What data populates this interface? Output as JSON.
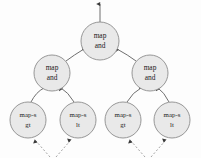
{
  "diagram": {
    "type": "tree",
    "background_color": "#fdfdfd",
    "node_fill_color": "#e9e9e9",
    "node_stroke_color": "#8c8c8c",
    "edge_color": "#6f6f6f",
    "dashed_edge_color": "#9a9a9a",
    "text_color": "#1a1a1a",
    "nodes": [
      {
        "id": "root",
        "level": 0,
        "line1": "map",
        "line2": "and",
        "cx": 100,
        "cy": 41,
        "r": 19
      },
      {
        "id": "mid-left",
        "level": 1,
        "line1": "map",
        "line2": "and",
        "cx": 52,
        "cy": 73,
        "r": 18
      },
      {
        "id": "mid-right",
        "level": 1,
        "line1": "map",
        "line2": "and",
        "cx": 150,
        "cy": 73,
        "r": 18
      },
      {
        "id": "leaf-1",
        "level": 2,
        "line1": "map-s",
        "line2": "gt",
        "cx": 28,
        "cy": 120,
        "r": 18
      },
      {
        "id": "leaf-2",
        "level": 2,
        "line1": "map-s",
        "line2": "lt",
        "cx": 78,
        "cy": 120,
        "r": 18
      },
      {
        "id": "leaf-3",
        "level": 2,
        "line1": "map-s",
        "line2": "gt",
        "cx": 123,
        "cy": 120,
        "r": 18
      },
      {
        "id": "leaf-4",
        "level": 2,
        "line1": "map-s",
        "line2": "lt",
        "cx": 172,
        "cy": 120,
        "r": 18
      }
    ],
    "edges": [
      {
        "from": "root",
        "to": "output",
        "style": "solid",
        "arrow": "up"
      },
      {
        "from": "mid-left",
        "to": "root",
        "style": "solid",
        "arrow": "up"
      },
      {
        "from": "mid-right",
        "to": "root",
        "style": "solid",
        "arrow": "up"
      },
      {
        "from": "leaf-1",
        "to": "mid-left",
        "style": "solid",
        "arrow": "up"
      },
      {
        "from": "leaf-2",
        "to": "mid-left",
        "style": "solid",
        "arrow": "up"
      },
      {
        "from": "leaf-3",
        "to": "mid-right",
        "style": "solid",
        "arrow": "up"
      },
      {
        "from": "leaf-4",
        "to": "mid-right",
        "style": "solid",
        "arrow": "up"
      },
      {
        "from": "input-left",
        "to": "leaf-1",
        "style": "dashed",
        "arrow": "up"
      },
      {
        "from": "input-left",
        "to": "leaf-2",
        "style": "dashed",
        "arrow": "up"
      },
      {
        "from": "input-right",
        "to": "leaf-3",
        "style": "dashed",
        "arrow": "up"
      },
      {
        "from": "input-right",
        "to": "leaf-4",
        "style": "dashed",
        "arrow": "up"
      }
    ]
  }
}
